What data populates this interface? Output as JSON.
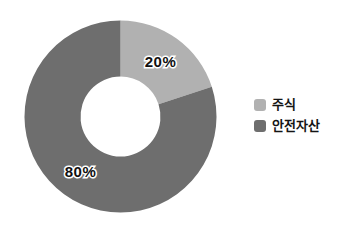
{
  "chart_data": {
    "type": "pie",
    "subtype": "donut",
    "title": "",
    "labels": [
      "주식",
      "안전자산"
    ],
    "values": [
      20,
      80
    ],
    "value_labels": [
      "20%",
      "80%"
    ],
    "colors": [
      "#b1b1b1",
      "#6e6e6e"
    ],
    "start_angle_deg": 0,
    "direction": "clockwise",
    "inner_radius_ratio": 0.42,
    "label_style": "black text with white outline",
    "legend_position": "right",
    "background": "#ffffff"
  }
}
